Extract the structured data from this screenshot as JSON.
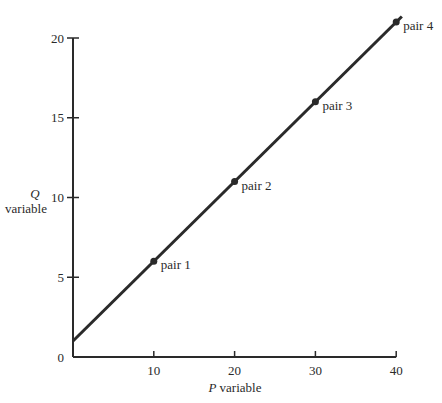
{
  "chart_data": {
    "type": "line",
    "title": "",
    "xlabel_italic": "P",
    "xlabel_rest": "variable",
    "ylabel_italic": "Q",
    "ylabel_rest": "variable",
    "xlim": [
      0,
      40
    ],
    "ylim": [
      0,
      20
    ],
    "x_ticks": [
      10,
      20,
      30,
      40
    ],
    "y_ticks": [
      0,
      5,
      10,
      15,
      20
    ],
    "grid": false,
    "line": {
      "intercept": 1,
      "slope": 0.5,
      "x_start": 0,
      "x_end": 40.7
    },
    "points": [
      {
        "label": "pair 1",
        "x": 10,
        "y": 6
      },
      {
        "label": "pair 2",
        "x": 20,
        "y": 11
      },
      {
        "label": "pair 3",
        "x": 30,
        "y": 16
      },
      {
        "label": "pair 4",
        "x": 40,
        "y": 21
      }
    ],
    "colors": {
      "line": "#2a2a2a",
      "axis": "#2a2a2a"
    }
  }
}
